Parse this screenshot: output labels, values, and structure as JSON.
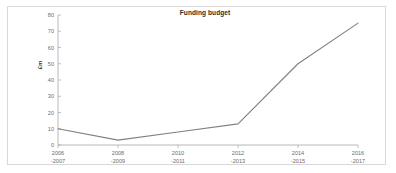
{
  "chart_data": {
    "type": "line",
    "title": "Funding budget",
    "xlabel": "",
    "ylabel": "£m",
    "ylim": [
      0,
      80
    ],
    "yticks": [
      0,
      10,
      20,
      30,
      40,
      50,
      60,
      70,
      80
    ],
    "grid": false,
    "legend": false,
    "line_color": "#808080",
    "categories": [
      "2006 -2007",
      "2008 -2009",
      "2010 -2011",
      "2012 -2013",
      "2014 -2015",
      "2016 -2017"
    ],
    "category_lines": [
      {
        "line1": "2006",
        "line2": "-2007"
      },
      {
        "line1": "2008",
        "line2": "-2009"
      },
      {
        "line1": "2010",
        "line2": "-2011"
      },
      {
        "line1": "2012",
        "line2": "-2013"
      },
      {
        "line1": "2014",
        "line2": "-2015"
      },
      {
        "line1": "2016",
        "line2": "-2017"
      }
    ],
    "values": [
      10,
      3,
      8,
      13,
      50,
      75
    ],
    "series": [
      {
        "name": "Funding budget",
        "values": [
          10,
          3,
          8,
          13,
          50,
          75
        ]
      }
    ]
  },
  "axis_colors": {
    "axis_line": "#a6a6a6",
    "tick_text": "#6d6d6d",
    "frame": "#d9d9d9"
  }
}
